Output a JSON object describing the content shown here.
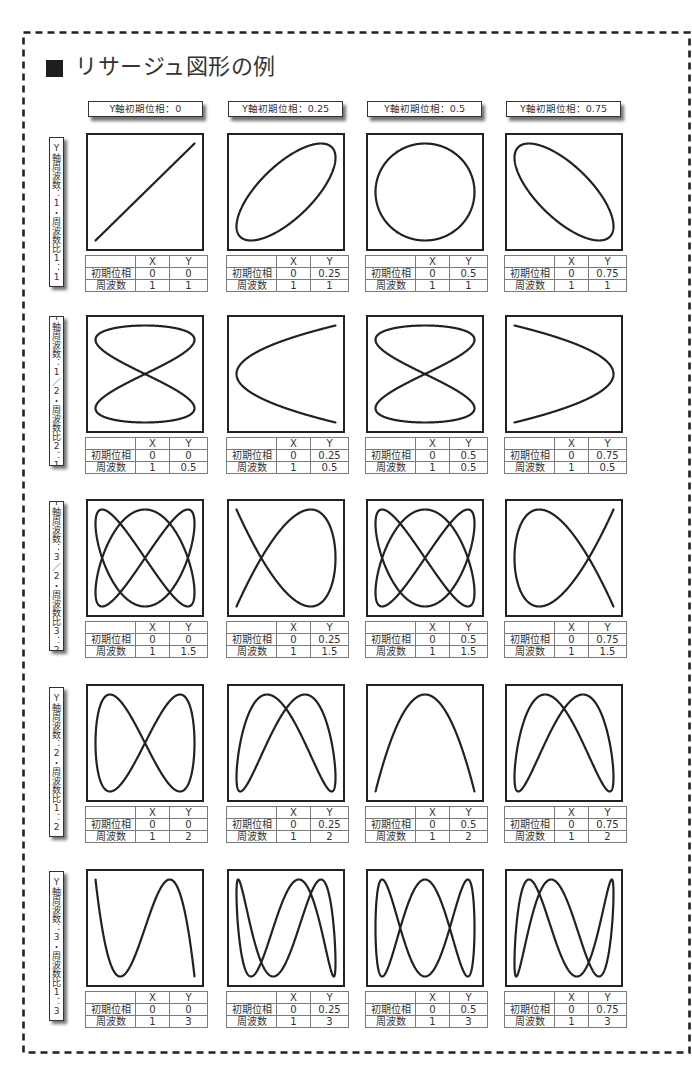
{
  "title": "リサージュ図形の例",
  "column_headers": [
    "Y軸初期位相：0",
    "Y軸初期位相：0.25",
    "Y軸初期位相：0.5",
    "Y軸初期位相：0.75"
  ],
  "table_labels": {
    "corner": "",
    "x": "X",
    "y": "Y",
    "initial_phase": "初期位相",
    "frequency": "周波数"
  },
  "colors": {
    "line": "#222222",
    "frame": "#222222"
  },
  "rows": [
    {
      "label": "Y軸周波数：1・周波数比1：1",
      "cells": [
        {
          "x_phase": "0",
          "y_phase": "0",
          "x_freq": "1",
          "y_freq": "1"
        },
        {
          "x_phase": "0",
          "y_phase": "0.25",
          "x_freq": "1",
          "y_freq": "1"
        },
        {
          "x_phase": "0",
          "y_phase": "0.5",
          "x_freq": "1",
          "y_freq": "1"
        },
        {
          "x_phase": "0",
          "y_phase": "0.75",
          "x_freq": "1",
          "y_freq": "1"
        }
      ]
    },
    {
      "label": "Y軸周波数：1／2・周波数比2：1",
      "cells": [
        {
          "x_phase": "0",
          "y_phase": "0",
          "x_freq": "1",
          "y_freq": "0.5"
        },
        {
          "x_phase": "0",
          "y_phase": "0.25",
          "x_freq": "1",
          "y_freq": "0.5"
        },
        {
          "x_phase": "0",
          "y_phase": "0.5",
          "x_freq": "1",
          "y_freq": "0.5"
        },
        {
          "x_phase": "0",
          "y_phase": "0.75",
          "x_freq": "1",
          "y_freq": "0.5"
        }
      ]
    },
    {
      "label": "Y軸周波数：3／2・周波数比3：2",
      "cells": [
        {
          "x_phase": "0",
          "y_phase": "0",
          "x_freq": "1",
          "y_freq": "1.5"
        },
        {
          "x_phase": "0",
          "y_phase": "0.25",
          "x_freq": "1",
          "y_freq": "1.5"
        },
        {
          "x_phase": "0",
          "y_phase": "0.5",
          "x_freq": "1",
          "y_freq": "1.5"
        },
        {
          "x_phase": "0",
          "y_phase": "0.75",
          "x_freq": "1",
          "y_freq": "1.5"
        }
      ]
    },
    {
      "label": "Y軸周波数：2・周波数比1：2",
      "cells": [
        {
          "x_phase": "0",
          "y_phase": "0",
          "x_freq": "1",
          "y_freq": "2"
        },
        {
          "x_phase": "0",
          "y_phase": "0.25",
          "x_freq": "1",
          "y_freq": "2"
        },
        {
          "x_phase": "0",
          "y_phase": "0.5",
          "x_freq": "1",
          "y_freq": "2"
        },
        {
          "x_phase": "0",
          "y_phase": "0.75",
          "x_freq": "1",
          "y_freq": "2"
        }
      ]
    },
    {
      "label": "Y軸周波数：3・周波数比1：3",
      "cells": [
        {
          "x_phase": "0",
          "y_phase": "0",
          "x_freq": "1",
          "y_freq": "3"
        },
        {
          "x_phase": "0",
          "y_phase": "0.25",
          "x_freq": "1",
          "y_freq": "3"
        },
        {
          "x_phase": "0",
          "y_phase": "0.5",
          "x_freq": "1",
          "y_freq": "3"
        },
        {
          "x_phase": "0",
          "y_phase": "0.75",
          "x_freq": "1",
          "y_freq": "3"
        }
      ]
    }
  ]
}
